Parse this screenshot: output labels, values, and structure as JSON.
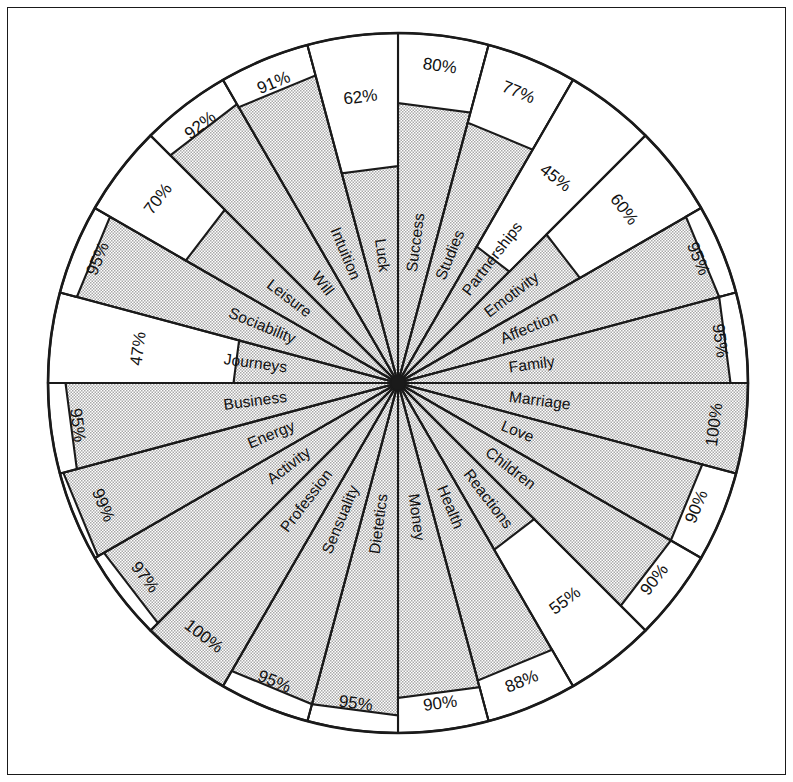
{
  "figure": {
    "type": "radar-wheel",
    "border": true,
    "background": "#ffffff",
    "line_color": "#1a1a1a",
    "fill_pattern": "dotted-gray",
    "fill_color": "#c9c9c9"
  },
  "chart_data": {
    "type": "pie",
    "title": "",
    "subtitle": "",
    "xlabel": "",
    "ylabel": "",
    "units": "%",
    "value_range": [
      0,
      100
    ],
    "sector_count": 24,
    "sector_angle_deg": 15,
    "start_angle_deg": -90,
    "direction": "clockwise",
    "grid": false,
    "legend": "none",
    "categories": [
      "Success",
      "Studies",
      "Partnerships",
      "Emotivity",
      "Affection",
      "Family",
      "Marriage",
      "Love",
      "Children",
      "Reactions",
      "Health",
      "Money",
      "Dietetics",
      "Sensuality",
      "Profession",
      "Activity",
      "Energy",
      "Business",
      "Journeys",
      "Sociability",
      "Leisure",
      "Will",
      "Intuition",
      "Luck"
    ],
    "values": [
      80,
      77,
      45,
      60,
      95,
      95,
      100,
      90,
      90,
      55,
      88,
      90,
      95,
      95,
      100,
      97,
      99,
      95,
      47,
      95,
      70,
      92,
      91,
      62
    ],
    "value_labels": [
      "80%",
      "77%",
      "45%",
      "60%",
      "95%",
      "95%",
      "100%",
      "90%",
      "90%",
      "55%",
      "88%",
      "90%",
      "95%",
      "95%",
      "100%",
      "97%",
      "99%",
      "95%",
      "47%",
      "95%",
      "70%",
      "92%",
      "91%",
      "62%"
    ],
    "sectors": [
      {
        "label": "Success",
        "value": 80,
        "value_label": "80%"
      },
      {
        "label": "Studies",
        "value": 77,
        "value_label": "77%"
      },
      {
        "label": "Partnerships",
        "value": 45,
        "value_label": "45%"
      },
      {
        "label": "Emotivity",
        "value": 60,
        "value_label": "60%"
      },
      {
        "label": "Affection",
        "value": 95,
        "value_label": "95%"
      },
      {
        "label": "Family",
        "value": 95,
        "value_label": "95%"
      },
      {
        "label": "Marriage",
        "value": 100,
        "value_label": "100%"
      },
      {
        "label": "Love",
        "value": 90,
        "value_label": "90%"
      },
      {
        "label": "Children",
        "value": 90,
        "value_label": "90%"
      },
      {
        "label": "Reactions",
        "value": 55,
        "value_label": "55%"
      },
      {
        "label": "Health",
        "value": 88,
        "value_label": "88%"
      },
      {
        "label": "Money",
        "value": 90,
        "value_label": "90%"
      },
      {
        "label": "Dietetics",
        "value": 95,
        "value_label": "95%"
      },
      {
        "label": "Sensuality",
        "value": 95,
        "value_label": "95%"
      },
      {
        "label": "Profession",
        "value": 100,
        "value_label": "100%"
      },
      {
        "label": "Activity",
        "value": 97,
        "value_label": "97%"
      },
      {
        "label": "Energy",
        "value": 99,
        "value_label": "99%"
      },
      {
        "label": "Business",
        "value": 95,
        "value_label": "95%"
      },
      {
        "label": "Journeys",
        "value": 47,
        "value_label": "47%"
      },
      {
        "label": "Sociability",
        "value": 95,
        "value_label": "95%"
      },
      {
        "label": "Leisure",
        "value": 70,
        "value_label": "70%"
      },
      {
        "label": "Will",
        "value": 92,
        "value_label": "92%"
      },
      {
        "label": "Intuition",
        "value": 91,
        "value_label": "91%"
      },
      {
        "label": "Luck",
        "value": 62,
        "value_label": "62%"
      }
    ],
    "geometry": {
      "center_x": 398,
      "center_y": 383,
      "outer_radius": 350
    }
  }
}
